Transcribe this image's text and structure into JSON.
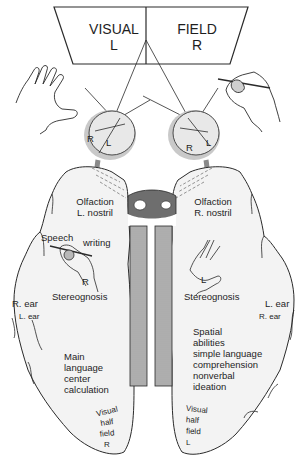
{
  "title_panel": {
    "left_line1": "VISUAL",
    "left_line2": "L",
    "right_line1": "FIELD",
    "right_line2": "R"
  },
  "eyes": {
    "left_eye": {
      "label_r": "R",
      "label_l": "L"
    },
    "right_eye": {
      "label_r": "R",
      "label_l": "L"
    }
  },
  "left_hemisphere": {
    "olfaction_line1": "Olfaction",
    "olfaction_line2": "L. nostril",
    "speech": "Speech",
    "writing": "writing",
    "hand_label": "R",
    "stereognosis": "Stereognosis",
    "ear_primary": "R. ear",
    "ear_secondary": "L. ear",
    "functions": [
      "Main",
      "language",
      "center",
      "calculation"
    ],
    "visual_field": [
      "Visual",
      "half",
      "field",
      "R"
    ]
  },
  "right_hemisphere": {
    "olfaction_line1": "Olfaction",
    "olfaction_line2": "R. nostril",
    "hand_label": "L",
    "stereognosis": "Stereognosis",
    "ear_primary": "L. ear",
    "ear_secondary": "R. ear",
    "functions": [
      "Spatial",
      "abilities",
      "simple language",
      "comprehension",
      "nonverbal",
      "ideation"
    ],
    "visual_field": [
      "Visual",
      "half",
      "field",
      "L"
    ]
  },
  "colors": {
    "line": "#2a2a2a",
    "hemisphere_fill": "#f3f3f3",
    "nerve_gray": "#8a8a8a",
    "eye_fill": "#e6e6e6"
  }
}
